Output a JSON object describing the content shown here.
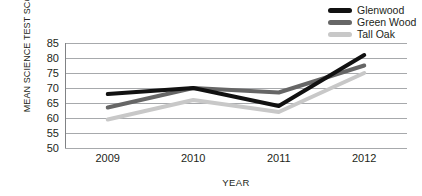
{
  "chart_data": {
    "type": "line",
    "title": "",
    "xlabel": "YEAR",
    "ylabel": "MEAN SCIENCE TEST SCORE",
    "categories": [
      "2009",
      "2010",
      "2011",
      "2012"
    ],
    "ylim": [
      50,
      85
    ],
    "yticks": [
      50,
      55,
      60,
      65,
      70,
      75,
      80,
      85
    ],
    "grid": true,
    "legend_position": "top-right",
    "series": [
      {
        "name": "Glenwood",
        "color": "#111111",
        "values": [
          68,
          70,
          64,
          81
        ]
      },
      {
        "name": "Green Wood",
        "color": "#666666",
        "values": [
          63.5,
          70,
          68.5,
          77.5
        ]
      },
      {
        "name": "Tall Oak",
        "color": "#c8c8c8",
        "values": [
          59.5,
          66,
          62,
          75
        ]
      }
    ]
  },
  "axis": {
    "y_title": "MEAN SCIENCE TEST SCORE",
    "x_title": "YEAR",
    "y_tick_labels": [
      "85",
      "80",
      "75",
      "70",
      "65",
      "60",
      "55",
      "50"
    ],
    "x_tick_labels": [
      "2009",
      "2010",
      "2011",
      "2012"
    ]
  },
  "legend": {
    "items": [
      {
        "label": "Glenwood",
        "color": "#111111"
      },
      {
        "label": "Green Wood",
        "color": "#666666"
      },
      {
        "label": "Tall Oak",
        "color": "#c8c8c8"
      }
    ]
  },
  "style": {
    "grid_color": "#a7a9ac",
    "axis_color": "#808285",
    "background": "#ffffff"
  }
}
